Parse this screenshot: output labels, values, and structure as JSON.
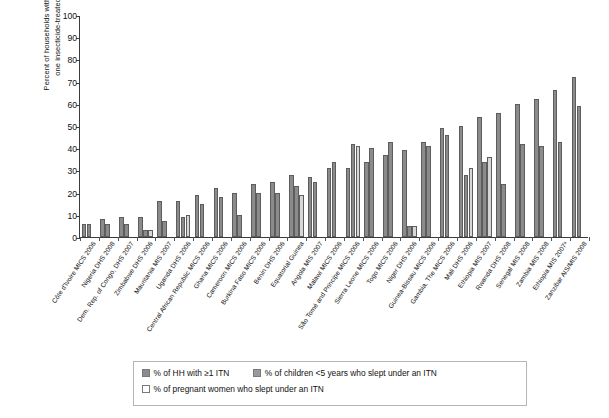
{
  "chart_data": {
    "type": "bar",
    "title": "",
    "xlabel": "",
    "ylabel": "Percent of households with at least\none insecticide-treated net",
    "ylim": [
      0,
      100
    ],
    "yticks": [
      0,
      10,
      20,
      30,
      40,
      50,
      60,
      70,
      80,
      90,
      100
    ],
    "grid": false,
    "legend_position": "bottom",
    "categories": [
      "Côte d'Ivoire MICS 2006",
      "Nigeria DHS 2008",
      "Dem. Rep. of Congo, DHS 2007",
      "Zimbabwe DHS 2006",
      "Mauritania MIS 2007",
      "Uganda DHS 2006",
      "Central African Republic MICS 2006",
      "Ghana MICS 2006",
      "Cameroon MICS 2006",
      "Burkina Faso MICS 2006",
      "Benin DHS 2006",
      "Equatorial Guinea",
      "Angola MIS 2007",
      "Malawi MICS 2006",
      "São Tomé and Principe MICS 2006",
      "Sierra Leone MICS 2006",
      "Togo MICS 2006",
      "Niger DHS 2006",
      "Guinea-Bissau MICS 2006",
      "Gambia, The MICS 2006",
      "Mali DHS 2006",
      "Ethiopia MIS 2007",
      "Rwanda DHS 2008",
      "Senegal MIS 2008",
      "Zambia MIS 2008",
      "Ethiopia MIS 2007ᵃ",
      "Zanzibar AIS/MIS 2008"
    ],
    "series": [
      {
        "name": "% of HH with ≥1 ITN",
        "key": "hh",
        "color": "#8b8b8b",
        "values": [
          6,
          8,
          9,
          9,
          16,
          16,
          19,
          22,
          20,
          24,
          25,
          28,
          27,
          31,
          31,
          34,
          37,
          39,
          43,
          49,
          50,
          54,
          56,
          60,
          62,
          66,
          72
        ]
      },
      {
        "name": "% of children <5 years who slept under an ITN",
        "key": "children",
        "color": "#8b8b8b",
        "values": [
          6,
          6,
          6,
          3,
          7,
          9,
          15,
          18,
          10,
          20,
          20,
          23,
          25,
          34,
          42,
          40,
          43,
          5,
          41,
          46,
          28,
          34,
          24,
          42,
          41,
          43,
          59
        ]
      },
      {
        "name": "% of pregnant women who slept under an ITN",
        "key": "pregnant",
        "color": "#d7d7d7",
        "values": [
          null,
          null,
          null,
          3,
          null,
          10,
          null,
          null,
          null,
          null,
          null,
          19,
          null,
          null,
          41,
          null,
          null,
          5,
          null,
          null,
          31,
          36,
          null,
          null,
          null,
          null,
          null
        ]
      }
    ]
  },
  "legend": {
    "items": [
      {
        "label": "% of HH with ≥1 ITN",
        "swatch": "dark-gray"
      },
      {
        "label": "% of children <5 years who slept under an ITN",
        "swatch": "mid-gray"
      },
      {
        "label": "% of pregnant women who slept under an ITN",
        "swatch": "light-gray"
      }
    ]
  }
}
